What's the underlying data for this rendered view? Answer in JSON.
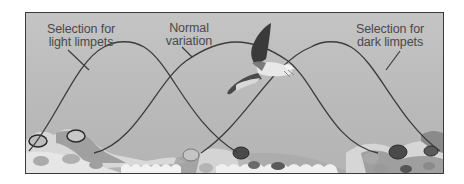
{
  "figure": {
    "labels": {
      "light": "Selection for light limpets",
      "light_line1": "Selection for",
      "light_line2": "light limpets",
      "normal": "Normal variation",
      "normal_line1": "Normal",
      "normal_line2": "variation",
      "dark": "Selection for dark limpets",
      "dark_line1": "Selection for",
      "dark_line2": "dark limpets"
    },
    "curves": [
      {
        "name": "light-limpets-curve",
        "peak_x": 128,
        "description": "bell curve shifted toward light shells"
      },
      {
        "name": "normal-variation-curve",
        "peak_x": 235,
        "description": "bell curve of normal variation, centered"
      },
      {
        "name": "dark-limpets-curve",
        "peak_x": 335,
        "description": "bell curve shifted toward dark shells"
      }
    ],
    "illustration": {
      "predator": "seagull",
      "substrate": "rocks with limpets",
      "water": "wave pattern at bottom center"
    },
    "colors": {
      "background": "#bdbdbd",
      "curve": "#3c3c3c",
      "text": "#4a4a4a",
      "frame": "#3a3a3a",
      "rock_light": "#dcdcdc",
      "rock_dark": "#8a8a8a",
      "water": "#f2f2f2"
    }
  }
}
